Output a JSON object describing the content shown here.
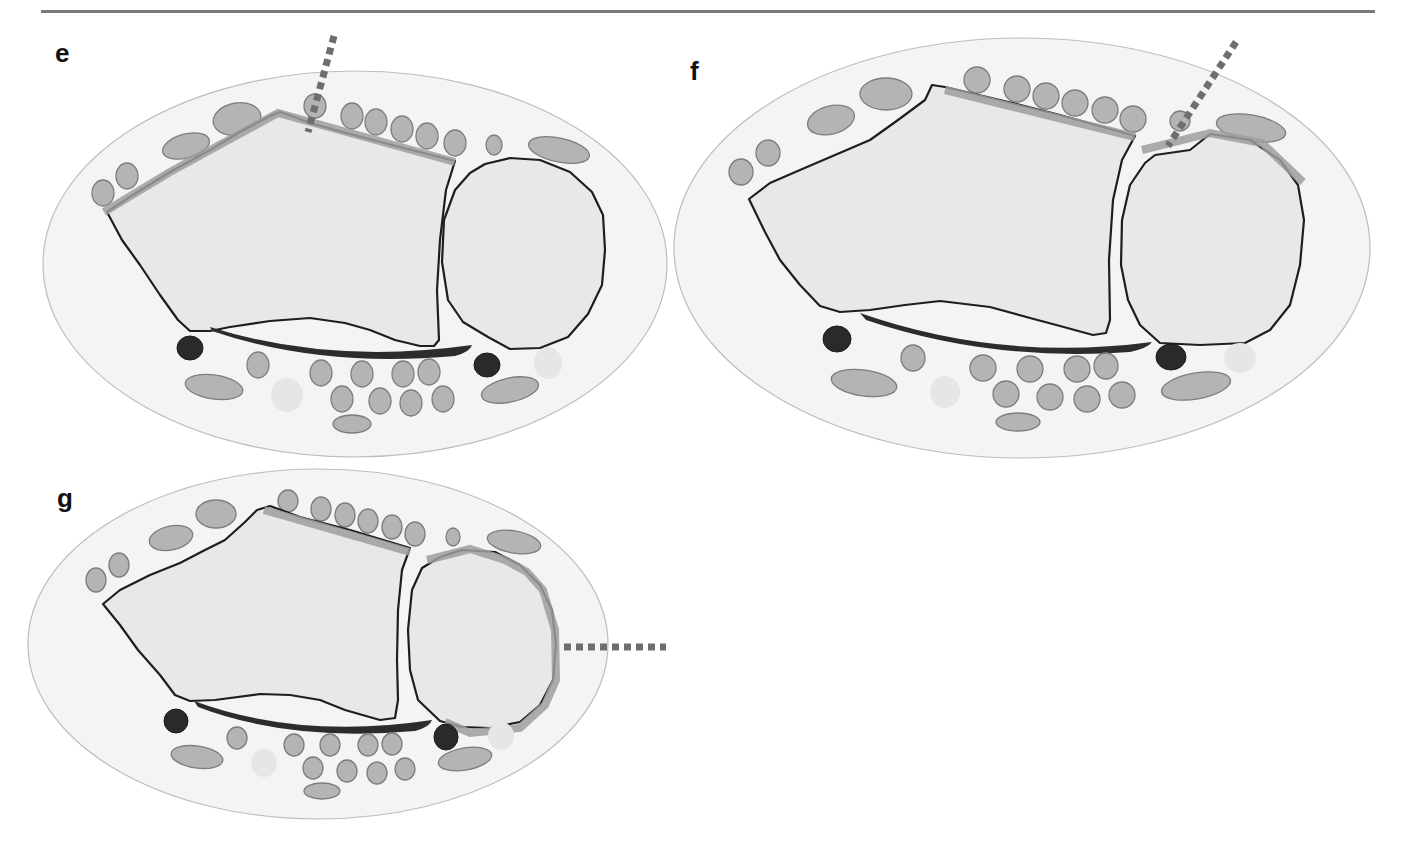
{
  "figure": {
    "panels": [
      {
        "id": "e",
        "label": "e"
      },
      {
        "id": "f",
        "label": "f"
      },
      {
        "id": "g",
        "label": "g"
      }
    ],
    "colors": {
      "outer_fill": "#f4f4f4",
      "bone_fill": "#e8e8e8",
      "bone_outline": "#1e1e1e",
      "muscle_fill": "#b4b4b4",
      "dark_structure": "#2a2a2a",
      "highlight_band": "#9d9d9d",
      "dotted_line": "#6e6e6e",
      "rule": "#7a7a7a"
    }
  }
}
